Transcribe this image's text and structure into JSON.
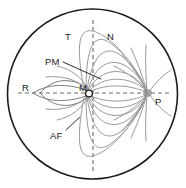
{
  "figure": {
    "type": "schematic-diagram",
    "canvas": {
      "width": 186,
      "height": 188,
      "background": "#ffffff"
    },
    "globe": {
      "name": "outer-circle",
      "center_x": 92.5,
      "center_y": 94,
      "radius": 85,
      "stroke": "#1a1a1a",
      "stroke_width": 1.6,
      "fill": "none"
    },
    "axes": {
      "horizontal": {
        "name": "horizontal-axis",
        "x1": 18,
        "y1": 93,
        "x2": 171,
        "y2": 93,
        "style": "dashed",
        "stroke": "#6b6b6b"
      },
      "vertical": {
        "name": "vertical-axis",
        "x1": 93,
        "y1": 20,
        "x2": 93,
        "y2": 172,
        "style": "dashed",
        "stroke": "#6b6b6b"
      }
    },
    "nodes": [
      {
        "id": "M",
        "label": "M",
        "x": 89,
        "y": 93,
        "marker": "open-circle",
        "radius": 3.4,
        "fill": "#ffffff",
        "stroke": "#1a1a1a"
      },
      {
        "id": "P",
        "label": "P",
        "x": 148,
        "y": 93,
        "marker": "focal-blob",
        "radius": 4.5,
        "fill": "#8d8d8d"
      }
    ],
    "labels": [
      {
        "id": "T",
        "text": "T",
        "x": 65,
        "y": 32,
        "anchor": "upper-left-quadrant"
      },
      {
        "id": "N",
        "text": "N",
        "x": 107,
        "y": 32,
        "anchor": "upper-right-quadrant"
      },
      {
        "id": "PM",
        "text": "PM",
        "x": 45,
        "y": 57,
        "anchor": "leader-to-curve"
      },
      {
        "id": "R",
        "text": "R",
        "x": 22,
        "y": 83,
        "anchor": "left-axis-end"
      },
      {
        "id": "M",
        "text": "M",
        "x": 79,
        "y": 83,
        "anchor": "center-node"
      },
      {
        "id": "P",
        "text": "P",
        "x": 155,
        "y": 97,
        "anchor": "right-focal-point"
      },
      {
        "id": "AF",
        "text": "AF",
        "x": 50,
        "y": 131,
        "anchor": "leader-to-curve"
      }
    ],
    "leaders": [
      {
        "id": "PM-leader",
        "x1": 63,
        "y1": 62,
        "x2": 101,
        "y2": 79,
        "target": "PM"
      },
      {
        "id": "AF-leader",
        "x1": 66,
        "y1": 130,
        "x2": 80,
        "y2": 117,
        "target": "AF"
      }
    ],
    "curve_family": {
      "name": "field-lines",
      "origin": "M",
      "convergence": "P",
      "count": 18,
      "stroke": "#9a9a9a",
      "description": "Bipolar lens-shaped curves from node M converging on focal point P, plus radial arcs fanning out from P toward the circle rim"
    },
    "colors": {
      "outline": "#1a1a1a",
      "axis": "#6b6b6b",
      "curve": "#9a9a9a",
      "curve_dark": "#7e7e7e",
      "label_text": "#1a1a1a",
      "background": "#ffffff"
    }
  }
}
